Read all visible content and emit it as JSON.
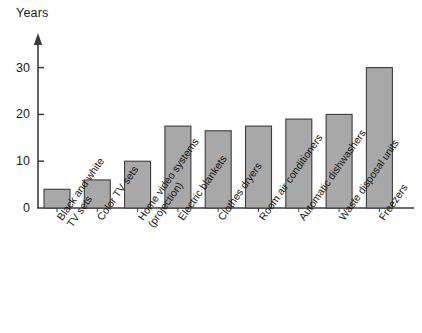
{
  "chart_data": {
    "type": "bar",
    "title": "",
    "subtitle": "",
    "xlabel": "",
    "ylabel": "Years",
    "ylim": [
      0,
      33
    ],
    "yticks": [
      0,
      10,
      20,
      30
    ],
    "ytick_labels": [
      "0",
      "10",
      "20",
      "30"
    ],
    "grid": false,
    "legend": false,
    "legend_position": "none",
    "axis_arrow": true,
    "bar_fill_color": "#a8a8a8",
    "bar_border_color": "#3c3c3c",
    "axis_color": "#3c3c3c",
    "background_color": "#ffffff",
    "categories": [
      "Black and white\nTV sets",
      "Color TV sets",
      "Home video systems\n(projection)",
      "Electric blankets",
      "Clothes dryers",
      "Room air conditioners",
      "Automatic dishwashers",
      "Waste disposal units",
      "Freezers"
    ],
    "values": [
      4,
      6,
      10,
      17.5,
      16.5,
      17.5,
      19,
      20,
      30
    ]
  },
  "axis": {
    "title": "Years"
  }
}
